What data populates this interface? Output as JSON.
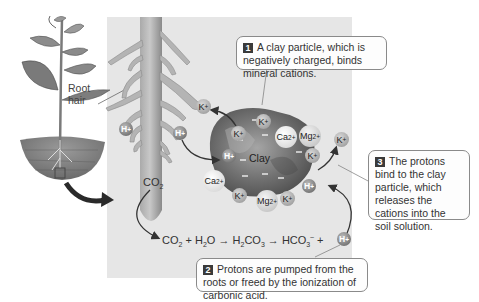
{
  "panel": {
    "background": "#e6e6e6"
  },
  "plant": {
    "label_line1": "Root",
    "label_line2": "hair"
  },
  "root": {
    "co2_label": "CO",
    "co2_sub": "2"
  },
  "clay": {
    "label": "Clay",
    "negative_charge": "–"
  },
  "ions": {
    "k": "K",
    "k_charge": "+",
    "h": "H",
    "h_charge": "+",
    "ca": "Ca",
    "ca_charge": "2+",
    "mg": "Mg",
    "mg_charge": "2+"
  },
  "equation": {
    "co2": "CO",
    "co2_sub": "2",
    "plus1": "+",
    "h2o_h": "H",
    "h2o_sub": "2",
    "h2o_o": "O",
    "arrow1": "→",
    "h2co3_h": "H",
    "h2co3_sub1": "2",
    "h2co3_co": "CO",
    "h2co3_sub2": "3",
    "arrow2": "→",
    "hco3": "HCO",
    "hco3_sub": "3",
    "hco3_charge": "–",
    "plus2": "+"
  },
  "callouts": [
    {
      "number": "1",
      "text": "A clay particle, which is negatively charged, binds mineral cations."
    },
    {
      "number": "2",
      "text": "Protons are pumped from the roots or freed by the ionization of carbonic acid."
    },
    {
      "number": "3",
      "text": "The protons bind to the clay particle, which releases the cations into the soil solution."
    }
  ]
}
